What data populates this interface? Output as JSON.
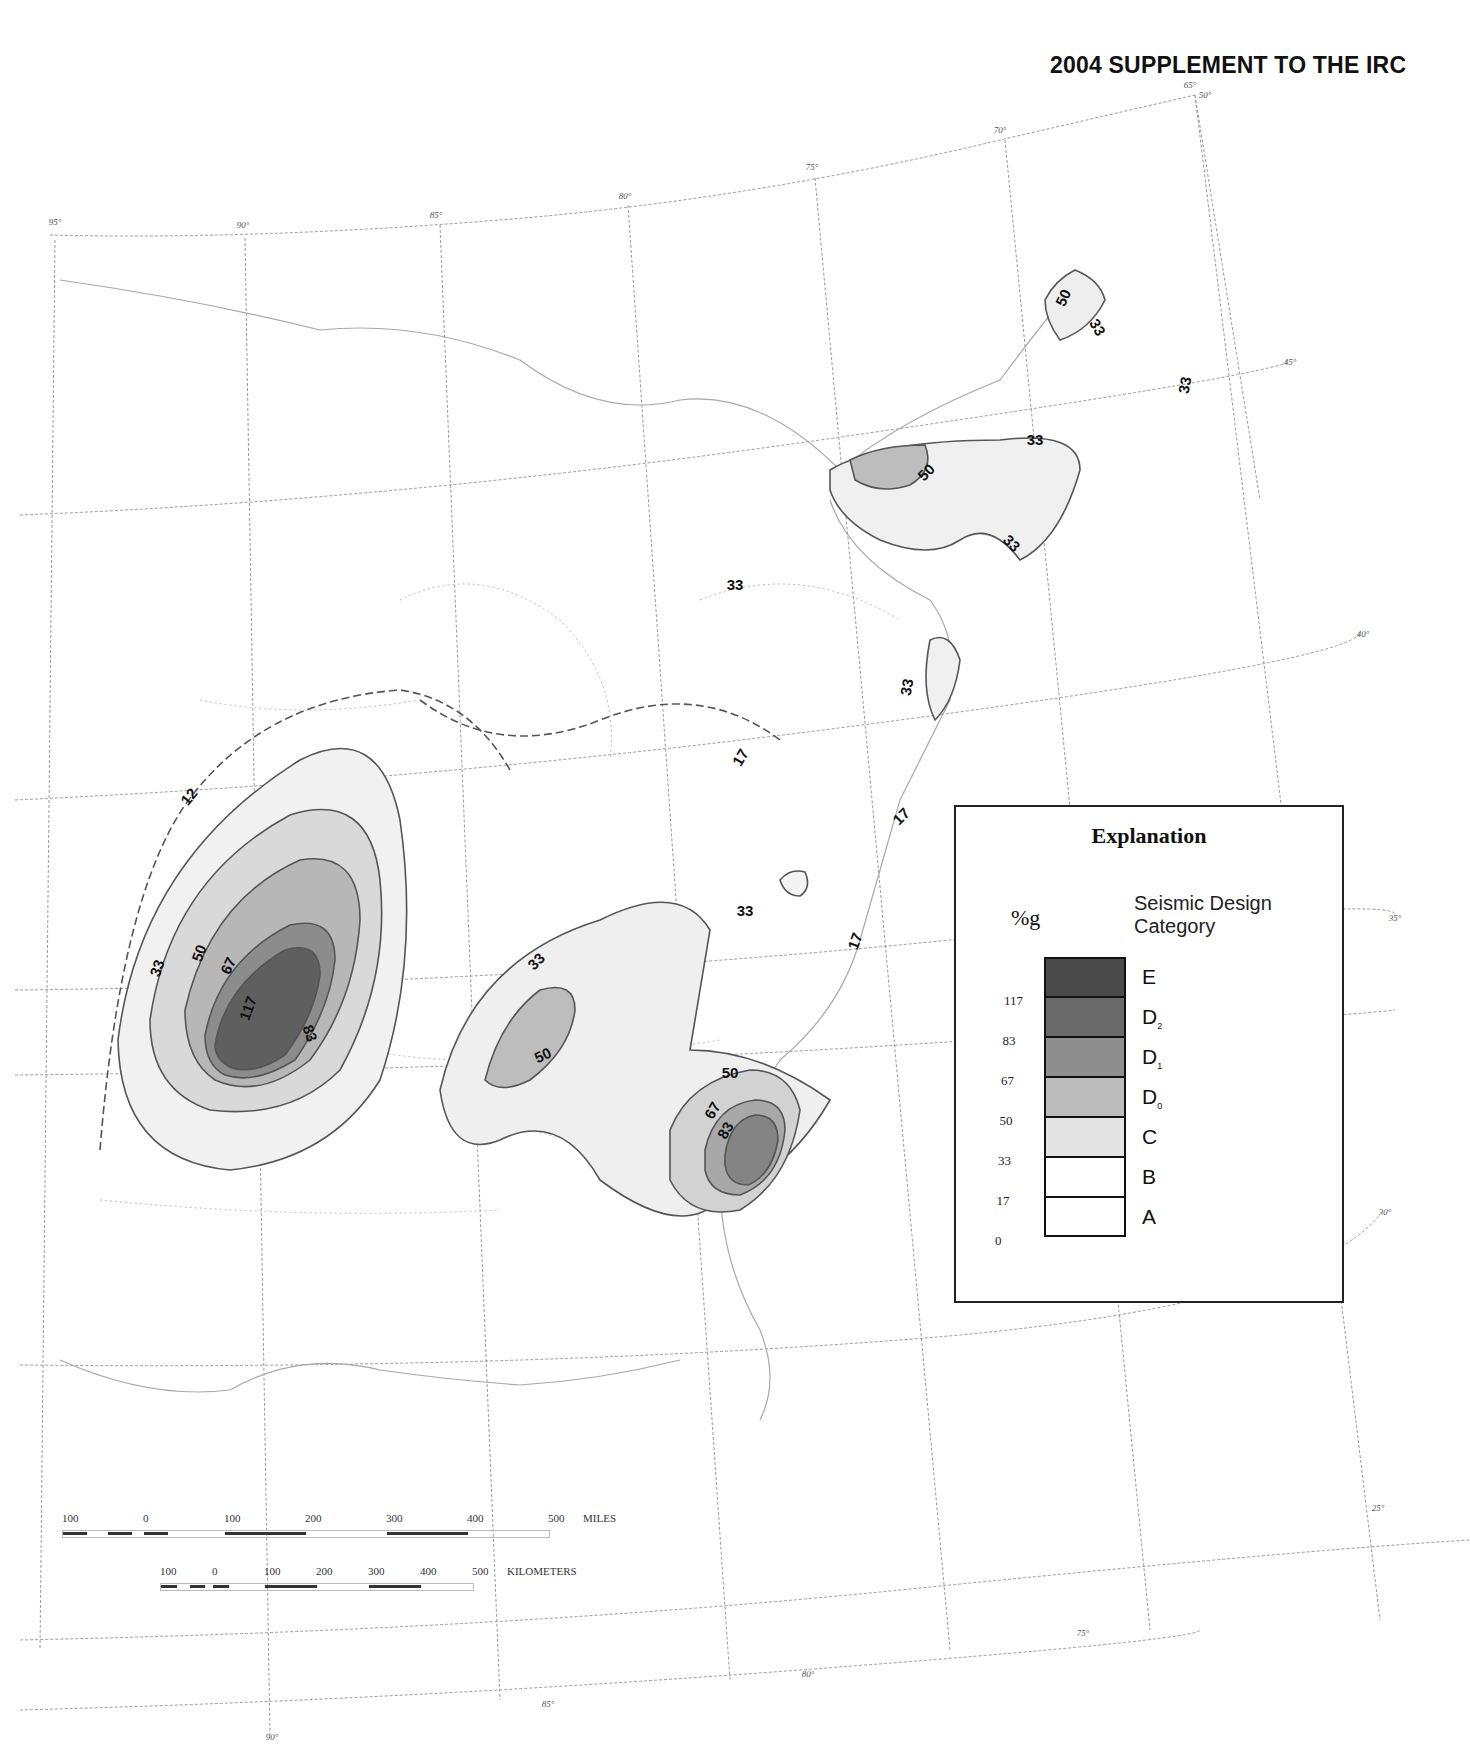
{
  "header": {
    "title": "2004 SUPPLEMENT TO THE IRC"
  },
  "map": {
    "longitude_ticks_top": [
      {
        "label": "95°",
        "x": 55,
        "y": 225
      },
      {
        "label": "90°",
        "x": 243,
        "y": 228
      },
      {
        "label": "85°",
        "x": 436,
        "y": 218
      },
      {
        "label": "80°",
        "x": 625,
        "y": 199
      },
      {
        "label": "75°",
        "x": 812,
        "y": 170
      },
      {
        "label": "70°",
        "x": 1000,
        "y": 133
      },
      {
        "label": "65°",
        "x": 1190,
        "y": 88
      },
      {
        "label": "50°",
        "x": 1205,
        "y": 98
      }
    ],
    "latitude_ticks_right": [
      {
        "label": "45°",
        "x": 1290,
        "y": 365
      },
      {
        "label": "40°",
        "x": 1363,
        "y": 637
      },
      {
        "label": "35°",
        "x": 1395,
        "y": 921
      },
      {
        "label": "30°",
        "x": 1385,
        "y": 1215
      },
      {
        "label": "25°",
        "x": 1378,
        "y": 1511
      }
    ],
    "longitude_ticks_bottom": [
      {
        "label": "90°",
        "x": 272,
        "y": 1740
      },
      {
        "label": "85°",
        "x": 548,
        "y": 1707
      },
      {
        "label": "80°",
        "x": 808,
        "y": 1677
      },
      {
        "label": "75°",
        "x": 1083,
        "y": 1636
      }
    ],
    "contour_labels": [
      {
        "text": "12",
        "x": 193,
        "y": 800,
        "rot": -50
      },
      {
        "text": "33",
        "x": 162,
        "y": 970,
        "rot": -70
      },
      {
        "text": "50",
        "x": 204,
        "y": 955,
        "rot": -70
      },
      {
        "text": "67",
        "x": 233,
        "y": 968,
        "rot": -65
      },
      {
        "text": "117",
        "x": 253,
        "y": 1010,
        "rot": -70
      },
      {
        "text": "83",
        "x": 305,
        "y": 1035,
        "rot": 70
      },
      {
        "text": "33",
        "x": 540,
        "y": 965,
        "rot": -45
      },
      {
        "text": "50",
        "x": 545,
        "y": 1060,
        "rot": -25
      },
      {
        "text": "50",
        "x": 730,
        "y": 1078,
        "rot": 0
      },
      {
        "text": "67",
        "x": 717,
        "y": 1113,
        "rot": -60
      },
      {
        "text": "83",
        "x": 730,
        "y": 1133,
        "rot": -60
      },
      {
        "text": "33",
        "x": 745,
        "y": 916,
        "rot": 0
      },
      {
        "text": "17",
        "x": 745,
        "y": 760,
        "rot": -60
      },
      {
        "text": "17",
        "x": 905,
        "y": 820,
        "rot": -45
      },
      {
        "text": "17",
        "x": 860,
        "y": 943,
        "rot": -70
      },
      {
        "text": "33",
        "x": 735,
        "y": 590,
        "rot": 0
      },
      {
        "text": "33",
        "x": 912,
        "y": 688,
        "rot": -80
      },
      {
        "text": "50",
        "x": 930,
        "y": 476,
        "rot": -45
      },
      {
        "text": "33",
        "x": 1035,
        "y": 445,
        "rot": 0
      },
      {
        "text": "33",
        "x": 1008,
        "y": 547,
        "rot": 45
      },
      {
        "text": "50",
        "x": 1068,
        "y": 300,
        "rot": -65
      },
      {
        "text": "33",
        "x": 1093,
        "y": 330,
        "rot": 60
      },
      {
        "text": "33",
        "x": 1190,
        "y": 386,
        "rot": -80
      }
    ]
  },
  "legend": {
    "title": "Explanation",
    "unit": "%g",
    "subtitle_line1": "Seismic Design",
    "subtitle_line2": "Category",
    "categories": [
      {
        "label": "E",
        "sub": "",
        "color": "#4a4a4a"
      },
      {
        "label": "D",
        "sub": "2",
        "color": "#6a6a6a"
      },
      {
        "label": "D",
        "sub": "1",
        "color": "#8e8e8e"
      },
      {
        "label": "D",
        "sub": "0",
        "color": "#bcbcbc"
      },
      {
        "label": "C",
        "sub": "",
        "color": "#e4e4e4"
      },
      {
        "label": "B",
        "sub": "",
        "color": "#ffffff"
      },
      {
        "label": "A",
        "sub": "",
        "color": "#ffffff"
      }
    ],
    "values": [
      "117",
      "83",
      "67",
      "50",
      "33",
      "17",
      "0"
    ]
  },
  "scale_bar": {
    "miles_ticks": [
      "100",
      "0",
      "100",
      "200",
      "300",
      "400",
      "500"
    ],
    "miles_label": "MILES",
    "km_ticks": [
      "100",
      "0",
      "100",
      "200",
      "300",
      "400",
      "500"
    ],
    "km_label": "KILOMETERS"
  },
  "chart_data": {
    "type": "map",
    "legend_unit": "%g",
    "bins": [
      {
        "category": "A",
        "range_pct_g": [
          0,
          17
        ]
      },
      {
        "category": "B",
        "range_pct_g": [
          17,
          33
        ]
      },
      {
        "category": "C",
        "range_pct_g": [
          33,
          50
        ]
      },
      {
        "category": "D0",
        "range_pct_g": [
          50,
          67
        ]
      },
      {
        "category": "D1",
        "range_pct_g": [
          67,
          83
        ]
      },
      {
        "category": "D2",
        "range_pct_g": [
          83,
          117
        ]
      },
      {
        "category": "E",
        "range_pct_g": [
          117,
          null
        ]
      }
    ],
    "contour_levels": [
      12,
      17,
      33,
      50,
      67,
      83,
      117
    ],
    "zones": [
      {
        "name": "New Madrid region",
        "max_level": 117
      },
      {
        "name": "Eastern Tennessee region",
        "max_level": 50
      },
      {
        "name": "Charleston SC region",
        "max_level": 83
      },
      {
        "name": "Northeast / St. Lawrence region",
        "max_level": 50
      }
    ],
    "longitudes_shown": [
      "95°",
      "90°",
      "85°",
      "80°",
      "75°",
      "70°",
      "65°"
    ],
    "latitudes_shown": [
      "45°",
      "40°",
      "35°",
      "30°",
      "25°"
    ]
  }
}
